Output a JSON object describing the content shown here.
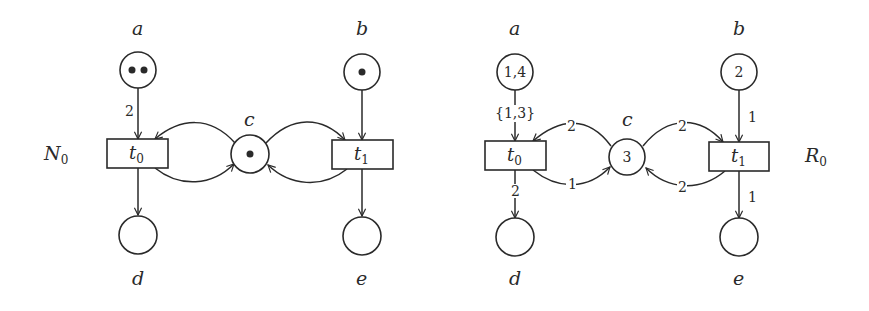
{
  "figure": {
    "type": "petri-net-pair",
    "colors": {
      "ink": "#2a2a2a",
      "background": "#ffffff"
    }
  },
  "left_net": {
    "name": "N",
    "name_sub": "0",
    "places": [
      {
        "id": "a",
        "label": "a",
        "tokens": 2
      },
      {
        "id": "b",
        "label": "b",
        "tokens": 1
      },
      {
        "id": "c",
        "label": "c",
        "tokens": 1
      },
      {
        "id": "d",
        "label": "d",
        "tokens": 0
      },
      {
        "id": "e",
        "label": "e",
        "tokens": 0
      }
    ],
    "transitions": [
      {
        "id": "t0",
        "label": "t",
        "sub": "0"
      },
      {
        "id": "t1",
        "label": "t",
        "sub": "1"
      }
    ],
    "arcs": [
      {
        "from": "a",
        "to": "t0",
        "weight": "2"
      },
      {
        "from": "c",
        "to": "t0",
        "weight": ""
      },
      {
        "from": "t0",
        "to": "c",
        "weight": ""
      },
      {
        "from": "t0",
        "to": "d",
        "weight": ""
      },
      {
        "from": "b",
        "to": "t1",
        "weight": ""
      },
      {
        "from": "c",
        "to": "t1",
        "weight": ""
      },
      {
        "from": "t1",
        "to": "c",
        "weight": ""
      },
      {
        "from": "t1",
        "to": "e",
        "weight": ""
      }
    ]
  },
  "right_net": {
    "name": "R",
    "name_sub": "0",
    "places": [
      {
        "id": "a",
        "label": "a",
        "value": "1,4"
      },
      {
        "id": "b",
        "label": "b",
        "value": "2"
      },
      {
        "id": "c",
        "label": "c",
        "value": "3"
      },
      {
        "id": "d",
        "label": "d",
        "value": ""
      },
      {
        "id": "e",
        "label": "e",
        "value": ""
      }
    ],
    "transitions": [
      {
        "id": "t0",
        "label": "t",
        "sub": "0"
      },
      {
        "id": "t1",
        "label": "t",
        "sub": "1"
      }
    ],
    "arcs": [
      {
        "from": "a",
        "to": "t0",
        "weight": "{1,3}"
      },
      {
        "from": "c",
        "to": "t0",
        "weight": "2"
      },
      {
        "from": "t0",
        "to": "c",
        "weight": "1"
      },
      {
        "from": "t0",
        "to": "d",
        "weight": "2"
      },
      {
        "from": "b",
        "to": "t1",
        "weight": "1"
      },
      {
        "from": "c",
        "to": "t1",
        "weight": "2"
      },
      {
        "from": "t1",
        "to": "c",
        "weight": "2"
      },
      {
        "from": "t1",
        "to": "e",
        "weight": "1"
      }
    ]
  }
}
